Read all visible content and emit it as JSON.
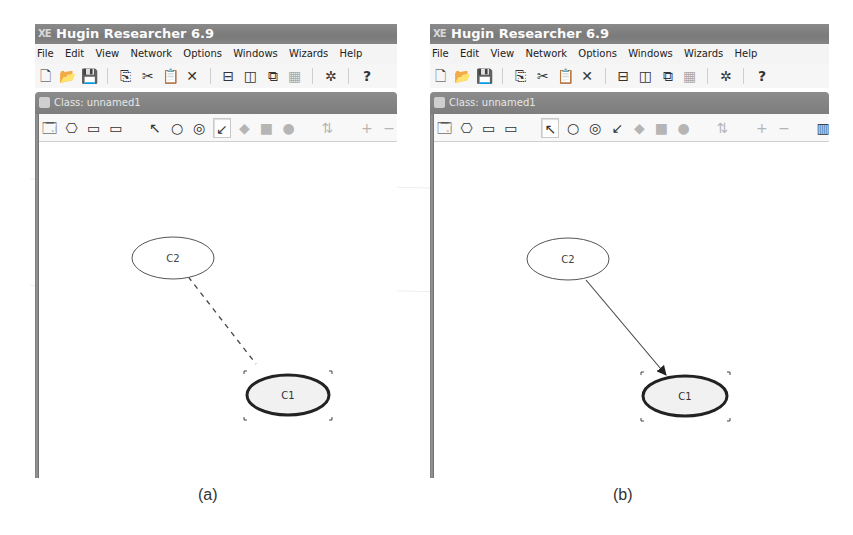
{
  "panels": [
    {
      "id": "a",
      "caption": "(a)",
      "app_title": "Hugin Researcher 6.9",
      "menu": [
        "File",
        "Edit",
        "View",
        "Network",
        "Options",
        "Windows",
        "Wizards",
        "Help"
      ],
      "class_window_title": "Class: unnamed1",
      "active_tool": "arrow-link-tool",
      "nodes": [
        {
          "label": "C2",
          "selected": false
        },
        {
          "label": "C1",
          "selected": true
        }
      ],
      "link": {
        "from": "C2",
        "to": "C1",
        "style": "dashed",
        "state": "being-drawn"
      }
    },
    {
      "id": "b",
      "caption": "(b)",
      "app_title": "Hugin Researcher 6.9",
      "menu": [
        "File",
        "Edit",
        "View",
        "Network",
        "Options",
        "Windows",
        "Wizards",
        "Help"
      ],
      "class_window_title": "Class: unnamed1",
      "active_tool": "select-pointer-tool",
      "nodes": [
        {
          "label": "C2",
          "selected": false
        },
        {
          "label": "C1",
          "selected": true
        }
      ],
      "link": {
        "from": "C2",
        "to": "C1",
        "style": "solid-arrow",
        "state": "created"
      }
    }
  ],
  "icons": {
    "main_toolbar": [
      "new-file-icon",
      "open-folder-icon",
      "save-disk-icon",
      "copy-icon",
      "cut-scissors-icon",
      "paste-icon",
      "delete-x-icon",
      "tile-horizontal-icon",
      "tile-vertical-icon",
      "cascade-windows-icon",
      "arrange-icons-icon",
      "network-wizard-icon",
      "help-question-icon"
    ],
    "node_toolbar": [
      "class-properties-icon",
      "network-properties-icon",
      "compile-icon",
      "run-mode-icon",
      "select-pointer-icon",
      "chance-node-icon",
      "discrete-node-icon",
      "link-arrow-icon",
      "decision-node-icon",
      "utility-node-icon",
      "instance-node-icon",
      "layout-icon",
      "zoom-in-icon",
      "zoom-out-icon",
      "table-view-icon",
      "node-list-icon"
    ]
  },
  "glyphs": {
    "appicon": "XE",
    "new": "🗋",
    "open": "📂",
    "save": "💾",
    "copy": "⎘",
    "cut": "✂",
    "paste": "📋",
    "delete": "✕",
    "tileh": "⊟",
    "tilev": "◫",
    "cascade": "⧉",
    "arrange": "▦",
    "wizard": "✲",
    "help": "?",
    "classprop": "🗔",
    "netprop": "⎔",
    "compile": "▭",
    "run": "▭",
    "pointer": "↖",
    "chance": "○",
    "discrete": "◎",
    "link": "↙",
    "decision": "◆",
    "utility": "■",
    "instance": "●",
    "layout": "⇅",
    "zoomin": "+",
    "zoomout": "−",
    "table": "▥",
    "list": "▤"
  }
}
